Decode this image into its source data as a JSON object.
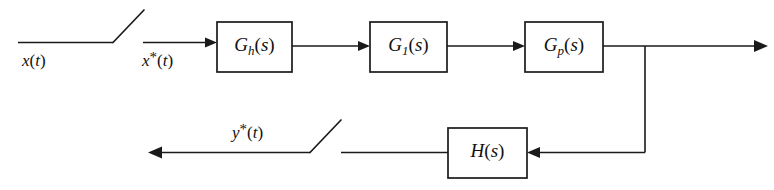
{
  "diagram": {
    "type": "block-diagram",
    "stroke_color": "#1a1a1a",
    "background_color": "#ffffff",
    "blocks": [
      {
        "id": "gh",
        "base": "G",
        "subscript": "h",
        "arg": "(s)",
        "label": "G_h(s)",
        "x": 217,
        "y": 22,
        "w": 75,
        "h": 50
      },
      {
        "id": "g1",
        "base": "G",
        "subscript": "1",
        "arg": "(s)",
        "label": "G_1(s)",
        "x": 370,
        "y": 22,
        "w": 77,
        "h": 50
      },
      {
        "id": "gp",
        "base": "G",
        "subscript": "p",
        "arg": "(s)",
        "label": "G_p(s)",
        "x": 525,
        "y": 22,
        "w": 78,
        "h": 50
      },
      {
        "id": "h",
        "base": "H",
        "subscript": "",
        "arg": "(s)",
        "label": "H(s)",
        "x": 448,
        "y": 128,
        "w": 79,
        "h": 50
      }
    ],
    "signals": [
      {
        "id": "xt",
        "base": "x",
        "star": "",
        "arg": "(t)",
        "label": "x(t)",
        "x": 22,
        "y": 66
      },
      {
        "id": "xstar",
        "base": "x",
        "star": "*",
        "arg": "(t)",
        "label": "x*(t)",
        "x": 142,
        "y": 66
      },
      {
        "id": "ystar",
        "base": "y",
        "star": "*",
        "arg": "(t)",
        "label": "y*(t)",
        "x": 232,
        "y": 138
      }
    ],
    "samplers": [
      {
        "id": "input-sampler",
        "pivot_x": 113,
        "pivot_y": 42,
        "tip_x": 144,
        "tip_y": 10
      },
      {
        "id": "output-sampler",
        "pivot_x": 310,
        "pivot_y": 152,
        "tip_x": 341,
        "tip_y": 120
      }
    ],
    "paths": {
      "forward_y": 46,
      "feedback_y": 152,
      "branch_x": 645,
      "output_arrow_x": 766,
      "output_arrow_left_x": 148
    }
  }
}
